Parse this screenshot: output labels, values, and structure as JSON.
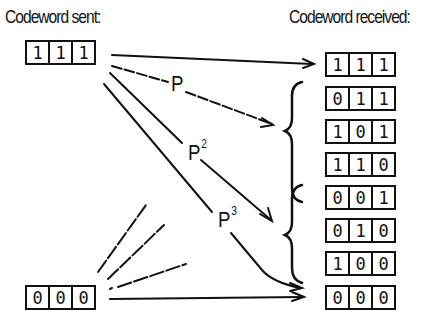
{
  "sent": {
    "heading": "Codeword sent:",
    "codewords": [
      {
        "bits": [
          "1",
          "1",
          "1"
        ]
      },
      {
        "bits": [
          "0",
          "0",
          "0"
        ]
      }
    ]
  },
  "received": {
    "heading": "Codeword received:",
    "codewords": [
      {
        "bits": [
          "1",
          "1",
          "1"
        ]
      },
      {
        "bits": [
          "0",
          "1",
          "1"
        ]
      },
      {
        "bits": [
          "1",
          "0",
          "1"
        ]
      },
      {
        "bits": [
          "1",
          "1",
          "0"
        ]
      },
      {
        "bits": [
          "0",
          "0",
          "1"
        ]
      },
      {
        "bits": [
          "0",
          "1",
          "0"
        ]
      },
      {
        "bits": [
          "1",
          "0",
          "0"
        ]
      },
      {
        "bits": [
          "0",
          "0",
          "0"
        ]
      }
    ]
  },
  "labels": {
    "p1": {
      "base": "P",
      "exp": ""
    },
    "p2": {
      "base": "P",
      "exp": "2"
    },
    "p3": {
      "base": "P",
      "exp": "3"
    }
  }
}
